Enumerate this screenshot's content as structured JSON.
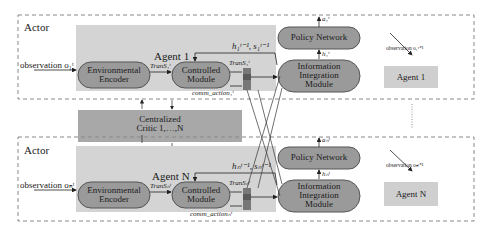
{
  "actor_top": {
    "title": "Actor",
    "agent_label": "Agent 1",
    "observation": "observation o₁ᵗ",
    "env_encoder": [
      "Environmental",
      "Encoder"
    ],
    "controlled_module": [
      "Controlled",
      "Module"
    ],
    "trans_in": "TranS₁ᵗ",
    "trans_out": "TranS₁ᵗ",
    "hidden_prev": "h₁ᵗ⁻¹, s₁ᵗ⁻¹",
    "comm_action": "comm_action₁ᵗ",
    "policy_network": "Policy Network",
    "info_integration": [
      "Information",
      "Integration",
      "Module"
    ],
    "action_out": "a₁ᵗ",
    "hidden_out": "h₁ᵗ",
    "next_obs": "observation o₁ᵗ⁺¹",
    "env_agent": "Agent 1"
  },
  "critic": {
    "label": [
      "Centralized",
      "Critic 1,…,N"
    ]
  },
  "actor_bottom": {
    "title": "Actor",
    "agent_label": "Agent N",
    "observation": "observation oₙᵗ",
    "env_encoder": [
      "Environmental",
      "Encoder"
    ],
    "controlled_module": [
      "Controlled",
      "Module"
    ],
    "trans_in": "TranSₙᵗ",
    "trans_out": "TranSₙᵗ",
    "hidden_prev": "hₙᵗ⁻¹, sₙᵗ⁻¹",
    "comm_action": "comm_actionₙᵗ",
    "policy_network": "Policy Network",
    "info_integration": [
      "Information",
      "Integration",
      "Module"
    ],
    "action_out": "aₙᵗ",
    "hidden_out": "hₙᵗ",
    "next_obs": "observation oₙᵗ⁺¹",
    "env_agent": "Agent N"
  },
  "colors": {
    "panel": "#d4d4d4",
    "module": "#9a9a9a",
    "env_box": "#cfcfcf",
    "stack_dark": "#6a6a6a",
    "dash": "#888888"
  }
}
